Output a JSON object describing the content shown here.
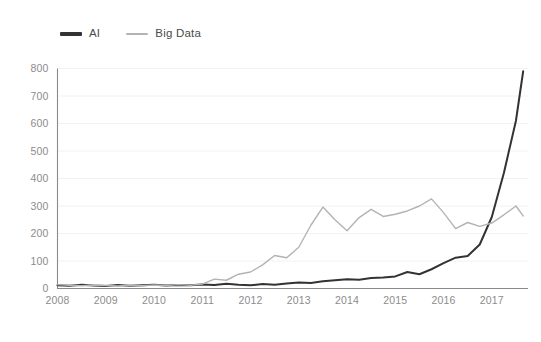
{
  "legend": {
    "position": "top-left",
    "items": [
      {
        "label": "AI",
        "color": "#333333",
        "width": 3.2
      },
      {
        "label": "Big Data",
        "color": "#b3b3b3",
        "width": 2.0
      }
    ]
  },
  "axes": {
    "y_ticks": [
      "0",
      "100",
      "200",
      "300",
      "400",
      "500",
      "600",
      "700",
      "800"
    ],
    "x_ticks": [
      "2008",
      "2009",
      "2010",
      "2011",
      "2012",
      "2013",
      "2014",
      "2015",
      "2016",
      "2017"
    ],
    "y_tick_color": "#8c8c8c",
    "x_tick_color": "#8c8c8c",
    "grid_color": "#f2f2f2",
    "spine_color": "#8a8a8a"
  },
  "chart_data": {
    "type": "line",
    "title": "",
    "subtitle": "",
    "xlabel": "",
    "ylabel": "",
    "xlim": [
      2008.0,
      2017.75
    ],
    "ylim": [
      0,
      800
    ],
    "yticks": [
      0,
      100,
      200,
      300,
      400,
      500,
      600,
      700,
      800
    ],
    "xticks": [
      2008,
      2009,
      2010,
      2011,
      2012,
      2013,
      2014,
      2015,
      2016,
      2017
    ],
    "grid": "horizontal",
    "legend_position": "top-left",
    "x": [
      2008.0,
      2008.25,
      2008.5,
      2008.75,
      2009.0,
      2009.25,
      2009.5,
      2009.75,
      2010.0,
      2010.25,
      2010.5,
      2010.75,
      2011.0,
      2011.25,
      2011.5,
      2011.75,
      2012.0,
      2012.25,
      2012.5,
      2012.75,
      2013.0,
      2013.25,
      2013.5,
      2013.75,
      2014.0,
      2014.25,
      2014.5,
      2014.75,
      2015.0,
      2015.25,
      2015.5,
      2015.75,
      2016.0,
      2016.25,
      2016.5,
      2016.75,
      2017.0,
      2017.25,
      2017.5,
      2017.65
    ],
    "series": [
      {
        "name": "AI",
        "color": "#333333",
        "values": [
          12,
          10,
          14,
          11,
          9,
          13,
          10,
          12,
          14,
          11,
          13,
          12,
          15,
          13,
          17,
          14,
          12,
          16,
          14,
          18,
          22,
          20,
          26,
          30,
          34,
          32,
          38,
          40,
          44,
          60,
          52,
          70,
          92,
          112,
          118,
          160,
          260,
          420,
          610,
          790
        ]
      },
      {
        "name": "Big Data",
        "color": "#b3b3b3",
        "values": [
          14,
          12,
          10,
          13,
          11,
          9,
          12,
          10,
          13,
          11,
          14,
          12,
          16,
          34,
          30,
          52,
          60,
          86,
          120,
          112,
          150,
          230,
          296,
          250,
          210,
          258,
          288,
          262,
          270,
          282,
          300,
          326,
          276,
          218,
          240,
          226,
          238,
          268,
          300,
          264
        ]
      }
    ]
  }
}
